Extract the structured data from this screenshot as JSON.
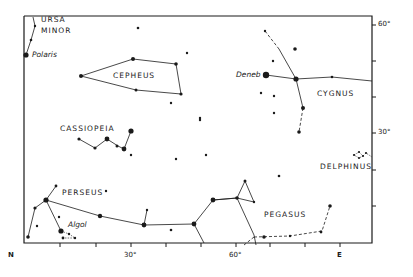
{
  "diagram": {
    "type": "star-chart",
    "axes": {
      "bottom_labels": [
        {
          "text": "N",
          "x": 10,
          "y": 250
        },
        {
          "text": "30°",
          "x": 124,
          "y": 250
        },
        {
          "text": "60°",
          "x": 228,
          "y": 250
        },
        {
          "text": "E",
          "x": 336,
          "y": 250
        }
      ],
      "right_labels": [
        {
          "text": "60°",
          "x": 376,
          "y": 20
        },
        {
          "text": "30°",
          "x": 376,
          "y": 128
        }
      ]
    },
    "constellations": [
      {
        "name": "URSA",
        "x": 41,
        "y": 15
      },
      {
        "name": "MINOR",
        "x": 41,
        "y": 26
      },
      {
        "name": "CEPHEUS",
        "x": 113,
        "y": 66
      },
      {
        "name": "CYGNUS",
        "x": 317,
        "y": 90
      },
      {
        "name": "CASSIOPEIA",
        "x": 60,
        "y": 123
      },
      {
        "name": "DELPHINUS",
        "x": 320,
        "y": 164
      },
      {
        "name": "PERSEUS",
        "x": 62,
        "y": 190
      },
      {
        "name": "PEGASUS",
        "x": 264,
        "y": 212
      }
    ],
    "star_names": [
      {
        "name": "Polaris",
        "x": 32,
        "y": 50
      },
      {
        "name": "Deneb",
        "x": 236,
        "y": 74
      },
      {
        "name": "Algol",
        "x": 68,
        "y": 223
      }
    ]
  }
}
